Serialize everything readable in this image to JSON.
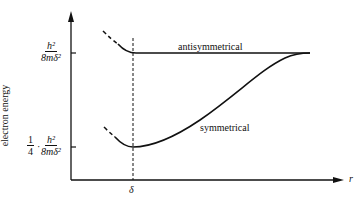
{
  "diagram": {
    "y_axis_label": "electron energy",
    "x_axis_label": "r",
    "upper_level": {
      "numerator": "h²",
      "denominator": "8mδ²"
    },
    "lower_level": {
      "prefix_numerator": "1",
      "prefix_denominator": "4",
      "dot": "·",
      "numerator": "h²",
      "denominator": "8mδ²"
    },
    "x_tick_label": "δ",
    "curves": [
      {
        "name": "antisymmetrical",
        "label": "antisymmetrical"
      },
      {
        "name": "symmetrical",
        "label": "symmetrical"
      }
    ],
    "colors": {
      "line": "#111111",
      "background": "#ffffff"
    }
  }
}
